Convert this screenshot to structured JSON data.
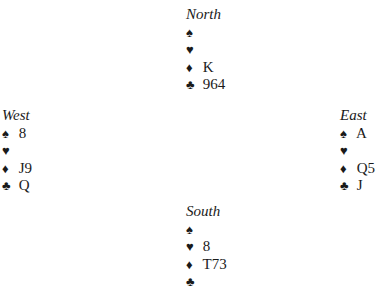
{
  "diagram": {
    "type": "bridge-deal",
    "hands": {
      "north": {
        "label": "North",
        "spades": "",
        "hearts": "",
        "diamonds": "K",
        "clubs": "964"
      },
      "west": {
        "label": "West",
        "spades": "8",
        "hearts": "",
        "diamonds": "J9",
        "clubs": "Q"
      },
      "east": {
        "label": "East",
        "spades": "A",
        "hearts": "",
        "diamonds": "Q5",
        "clubs": "J"
      },
      "south": {
        "label": "South",
        "spades": "",
        "hearts": "8",
        "diamonds": "T73",
        "clubs": ""
      }
    },
    "suit_symbols": {
      "spades": "♠",
      "hearts": "♥",
      "diamonds": "♦",
      "clubs": "♣"
    }
  }
}
